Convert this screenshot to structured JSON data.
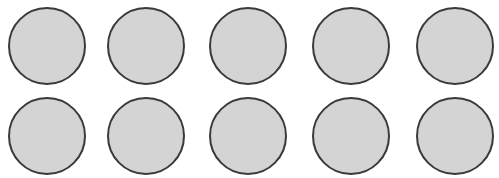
{
  "figure": {
    "rows": 2,
    "columns": 5,
    "fill_color": "#d4d4d4",
    "stroke_color": "#3a3a3a",
    "circles": [
      {
        "row": 1,
        "col": 1,
        "cx": 47,
        "cy": 46
      },
      {
        "row": 1,
        "col": 2,
        "cx": 146,
        "cy": 46
      },
      {
        "row": 1,
        "col": 3,
        "cx": 248,
        "cy": 46
      },
      {
        "row": 1,
        "col": 4,
        "cx": 351,
        "cy": 46
      },
      {
        "row": 1,
        "col": 5,
        "cx": 455,
        "cy": 46
      },
      {
        "row": 2,
        "col": 1,
        "cx": 47,
        "cy": 136
      },
      {
        "row": 2,
        "col": 2,
        "cx": 146,
        "cy": 136
      },
      {
        "row": 2,
        "col": 3,
        "cx": 248,
        "cy": 136
      },
      {
        "row": 2,
        "col": 4,
        "cx": 351,
        "cy": 136
      },
      {
        "row": 2,
        "col": 5,
        "cx": 455,
        "cy": 136
      }
    ]
  }
}
